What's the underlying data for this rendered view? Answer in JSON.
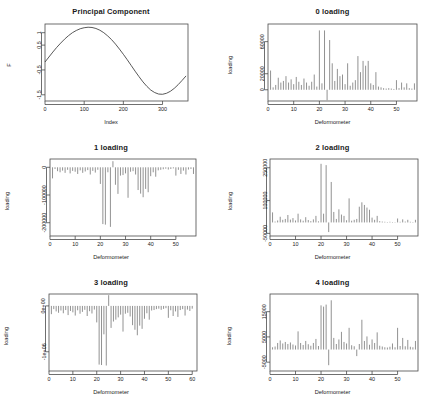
{
  "figure": {
    "layout": "2 columns x 3 rows of R base-graphics plots",
    "background": "#ffffff",
    "line_color": "#3a3a3a",
    "spike_color": "#6e6e6e",
    "axis_color": "#4a4a4a"
  },
  "chart_data": [
    {
      "id": "principal-component",
      "type": "line",
      "title": "Principal Component",
      "xlabel": "Index",
      "ylabel": "F",
      "xticks": [
        0,
        100,
        200,
        300
      ],
      "yticks": [
        1.0,
        0.5,
        -0.5,
        -1.5
      ],
      "xlim": [
        0,
        365
      ],
      "ylim": [
        -1.75,
        1.35
      ],
      "grid": false,
      "legend": null,
      "x": [
        0,
        10,
        20,
        30,
        40,
        50,
        60,
        70,
        80,
        90,
        100,
        110,
        120,
        130,
        140,
        150,
        160,
        170,
        180,
        190,
        200,
        210,
        220,
        230,
        240,
        250,
        260,
        270,
        280,
        290,
        300,
        310,
        320,
        330,
        340,
        350,
        360
      ],
      "values": [
        -0.18,
        0.02,
        0.22,
        0.41,
        0.58,
        0.74,
        0.88,
        1.0,
        1.09,
        1.16,
        1.2,
        1.22,
        1.21,
        1.17,
        1.1,
        1.0,
        0.87,
        0.72,
        0.54,
        0.34,
        0.13,
        -0.09,
        -0.32,
        -0.55,
        -0.77,
        -0.98,
        -1.16,
        -1.31,
        -1.41,
        -1.47,
        -1.48,
        -1.44,
        -1.36,
        -1.24,
        -1.09,
        -0.92,
        -0.74
      ]
    },
    {
      "id": "loading-0",
      "type": "bar",
      "title": "0 loading",
      "xlabel": "Deformometer",
      "ylabel": "loading",
      "xticks": [
        0,
        10,
        20,
        30,
        40,
        50
      ],
      "yticks": [
        0,
        20000,
        60000
      ],
      "xlim": [
        0,
        58
      ],
      "ylim": [
        -14000,
        82000
      ],
      "grid": false,
      "legend": null,
      "categories": [
        1,
        2,
        3,
        4,
        5,
        6,
        7,
        8,
        9,
        10,
        11,
        12,
        13,
        14,
        15,
        16,
        17,
        18,
        19,
        20,
        21,
        22,
        23,
        24,
        25,
        26,
        27,
        28,
        29,
        30,
        31,
        32,
        33,
        34,
        35,
        36,
        37,
        38,
        39,
        40,
        41,
        42,
        43,
        44,
        45,
        46,
        47,
        48,
        49,
        50,
        51,
        52,
        53,
        54,
        55,
        56,
        57
      ],
      "values": [
        24000,
        3000,
        6000,
        15000,
        9000,
        11000,
        17000,
        9000,
        13000,
        7000,
        16000,
        10000,
        6000,
        14000,
        9000,
        5000,
        10000,
        19000,
        4000,
        74000,
        8000,
        74000,
        -13000,
        62000,
        33000,
        11000,
        26000,
        17000,
        19000,
        7000,
        33000,
        5000,
        9000,
        12000,
        42000,
        22000,
        36000,
        30000,
        36000,
        8000,
        6000,
        22000,
        4000,
        3000,
        2000,
        1500,
        2000,
        1500,
        1000,
        12000,
        2000,
        9000,
        3000,
        8000,
        2000,
        1500,
        8000
      ]
    },
    {
      "id": "loading-1",
      "type": "bar",
      "title": "1 loading",
      "xlabel": "Deformometer",
      "ylabel": "loading",
      "xticks": [
        0,
        10,
        20,
        30,
        40,
        50
      ],
      "yticks": [
        0,
        -100000,
        -200000
      ],
      "xlim": [
        0,
        58
      ],
      "ylim": [
        -248000,
        30000
      ],
      "grid": false,
      "legend": null,
      "categories": [
        1,
        2,
        3,
        4,
        5,
        6,
        7,
        8,
        9,
        10,
        11,
        12,
        13,
        14,
        15,
        16,
        17,
        18,
        19,
        20,
        21,
        22,
        23,
        24,
        25,
        26,
        27,
        28,
        29,
        30,
        31,
        32,
        33,
        34,
        35,
        36,
        37,
        38,
        39,
        40,
        41,
        42,
        43,
        44,
        45,
        46,
        47,
        48,
        49,
        50,
        51,
        52,
        53,
        54,
        55,
        56,
        57
      ],
      "values": [
        -40000,
        -6000,
        -14000,
        -18000,
        -12000,
        -20000,
        -9000,
        -22000,
        -13000,
        -16000,
        -24000,
        -11000,
        -20000,
        -15000,
        -10000,
        -26000,
        -13000,
        -19000,
        -9000,
        -60000,
        -205000,
        -207000,
        -18000,
        -215000,
        22000,
        -63000,
        -96000,
        -30000,
        -28000,
        -22000,
        -110000,
        -16000,
        -14000,
        -26000,
        -82000,
        -95000,
        -108000,
        -78000,
        -90000,
        -32000,
        -18000,
        -34000,
        -11000,
        -9000,
        -7000,
        -5000,
        -8000,
        -6000,
        -4000,
        -30000,
        -9000,
        -24000,
        -12000,
        -26000,
        -8000,
        -6000,
        -24000
      ]
    },
    {
      "id": "loading-2",
      "type": "bar",
      "title": "2 loading",
      "xlabel": "Deformometer",
      "ylabel": "loading",
      "xticks": [
        0,
        10,
        20,
        30,
        40,
        50
      ],
      "yticks": [
        -50000,
        100000,
        250000
      ],
      "xlim": [
        0,
        58
      ],
      "ylim": [
        -62000,
        290000
      ],
      "grid": false,
      "legend": null,
      "categories": [
        1,
        2,
        3,
        4,
        5,
        6,
        7,
        8,
        9,
        10,
        11,
        12,
        13,
        14,
        15,
        16,
        17,
        18,
        19,
        20,
        21,
        22,
        23,
        24,
        25,
        26,
        27,
        28,
        29,
        30,
        31,
        32,
        33,
        34,
        35,
        36,
        37,
        38,
        39,
        40,
        41,
        42,
        43,
        44,
        45,
        46,
        47,
        48,
        49,
        50,
        51,
        52,
        53,
        54,
        55,
        56,
        57
      ],
      "values": [
        46000,
        4000,
        9000,
        26000,
        12000,
        16000,
        34000,
        13000,
        20000,
        9000,
        40000,
        14000,
        8000,
        24000,
        11000,
        6000,
        14000,
        30000,
        5000,
        268000,
        40000,
        262000,
        -44000,
        185000,
        48000,
        16000,
        60000,
        36000,
        30000,
        10000,
        110000,
        8000,
        12000,
        16000,
        72000,
        92000,
        80000,
        68000,
        58000,
        22000,
        12000,
        30000,
        6000,
        4000,
        3000,
        2000,
        3000,
        2000,
        1500,
        18000,
        3000,
        14000,
        4000,
        12000,
        3000,
        2000,
        12000
      ]
    },
    {
      "id": "loading-3",
      "type": "bar",
      "title": "3 loading",
      "xlabel": "Deformometer",
      "ylabel": "loading",
      "xticks": [
        0,
        10,
        20,
        30,
        40,
        50,
        60
      ],
      "yticks": [
        "0e+00",
        "-1e+06"
      ],
      "ytick_values": [
        0,
        -1000000
      ],
      "xlim": [
        0,
        62
      ],
      "ylim": [
        -1420000,
        260000
      ],
      "grid": false,
      "legend": null,
      "categories": [
        1,
        2,
        3,
        4,
        5,
        6,
        7,
        8,
        9,
        10,
        11,
        12,
        13,
        14,
        15,
        16,
        17,
        18,
        19,
        20,
        21,
        22,
        23,
        24,
        25,
        26,
        27,
        28,
        29,
        30,
        31,
        32,
        33,
        34,
        35,
        36,
        37,
        38,
        39,
        40,
        41,
        42,
        43,
        44,
        45,
        46,
        47,
        48,
        49,
        50,
        51,
        52,
        53,
        54,
        55,
        56,
        57,
        58,
        59,
        60
      ],
      "values": [
        -180000,
        -70000,
        -120000,
        -150000,
        -100000,
        -160000,
        -90000,
        -200000,
        -110000,
        -140000,
        -210000,
        -95000,
        -170000,
        -130000,
        -85000,
        -220000,
        -115000,
        -165000,
        -80000,
        -360000,
        -1280000,
        -1290000,
        -620000,
        -1300000,
        235000,
        -480000,
        -340000,
        -300000,
        -250000,
        -190000,
        -560000,
        -170000,
        -150000,
        -230000,
        -420000,
        -520000,
        -640000,
        -430000,
        -500000,
        -280000,
        -160000,
        -300000,
        -100000,
        -90000,
        -70000,
        -60000,
        -85000,
        -65000,
        -50000,
        -260000,
        -95000,
        -220000,
        -120000,
        -240000,
        -90000,
        -70000,
        -210000,
        -80000,
        -110000,
        -60000
      ]
    },
    {
      "id": "loading-4",
      "type": "bar",
      "title": "4 loading",
      "xlabel": "Deformometer",
      "ylabel": "loading",
      "xticks": [
        0,
        10,
        20,
        30,
        40,
        50
      ],
      "yticks": [
        -5000,
        5000,
        15000
      ],
      "xlim": [
        0,
        58
      ],
      "ylim": [
        -8500,
        22000
      ],
      "grid": false,
      "legend": null,
      "categories": [
        1,
        2,
        3,
        4,
        5,
        6,
        7,
        8,
        9,
        10,
        11,
        12,
        13,
        14,
        15,
        16,
        17,
        18,
        19,
        20,
        21,
        22,
        23,
        24,
        25,
        26,
        27,
        28,
        29,
        30,
        31,
        32,
        33,
        34,
        35,
        36,
        37,
        38,
        39,
        40,
        41,
        42,
        43,
        44,
        45,
        46,
        47,
        48,
        49,
        50,
        51,
        52,
        53,
        54,
        55,
        56,
        57
      ],
      "values": [
        900,
        1200,
        2600,
        3600,
        2400,
        3000,
        2200,
        2800,
        2000,
        1600,
        7200,
        2600,
        1800,
        3400,
        2100,
        1500,
        2600,
        4200,
        1400,
        17500,
        17000,
        17800,
        -6200,
        19500,
        4600,
        2200,
        4000,
        7000,
        3000,
        2400,
        8600,
        1700,
        1300,
        -2600,
        2200,
        11800,
        3400,
        5200,
        1900,
        4000,
        2600,
        6800,
        1500,
        1200,
        900,
        800,
        1100,
        2400,
        900,
        8600,
        1400,
        4600,
        1300,
        3800,
        1100,
        900,
        3400
      ]
    }
  ]
}
